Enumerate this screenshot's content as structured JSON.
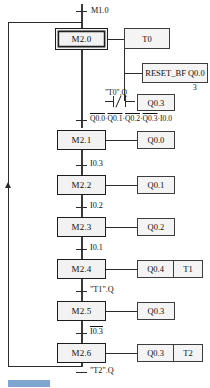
{
  "diagram": {
    "type": "sfc-sequential-function-chart",
    "title": "",
    "initial_transition": {
      "label": "M1.0"
    },
    "steps": [
      {
        "id": "step-m20",
        "label": "M2.0",
        "initial": true
      },
      {
        "id": "step-m21",
        "label": "M2.1",
        "initial": false
      },
      {
        "id": "step-m22",
        "label": "M2.2",
        "initial": false
      },
      {
        "id": "step-m23",
        "label": "M2.3",
        "initial": false
      },
      {
        "id": "step-m24",
        "label": "M2.4",
        "initial": false
      },
      {
        "id": "step-m25",
        "label": "M2.5",
        "initial": false
      },
      {
        "id": "step-m26",
        "label": "M2.6",
        "initial": false
      }
    ],
    "actions": {
      "t0": {
        "label": "T0"
      },
      "reset_bf": {
        "label": "RESET_BF Q0.0",
        "count": "3"
      },
      "contact": {
        "label": "\"T0\".Q",
        "type": "normally-closed"
      },
      "contact_out": {
        "label": "Q0.3"
      },
      "q00": {
        "label": "Q0.0"
      },
      "q01": {
        "label": "Q0.1"
      },
      "q02": {
        "label": "Q0.2"
      },
      "q04": {
        "label": "Q0.4"
      },
      "t1": {
        "label": "T1"
      },
      "q03_m25": {
        "label": "Q0.3"
      },
      "q03_m26": {
        "label": "Q0.3"
      },
      "t2": {
        "label": "T2"
      }
    },
    "transitions": [
      {
        "id": "tr-m20-m21",
        "terms": [
          {
            "text": "Q0.0",
            "negated": true
          },
          {
            "text": "Q0.1",
            "negated": true
          },
          {
            "text": "Q0.2",
            "negated": true
          },
          {
            "text": "Q0.3",
            "negated": true
          },
          {
            "text": "I0.0",
            "negated": false
          }
        ],
        "separator": "·"
      },
      {
        "id": "tr-m21-m22",
        "label": "I0.3",
        "negated": false
      },
      {
        "id": "tr-m22-m23",
        "label": "I0.2",
        "negated": false
      },
      {
        "id": "tr-m23-m24",
        "label": "I0.1",
        "negated": false
      },
      {
        "id": "tr-m24-m25",
        "label": "\"T1\".Q",
        "negated": false
      },
      {
        "id": "tr-m25-m26",
        "label": "I0.3",
        "negated": true
      },
      {
        "id": "tr-m26-return",
        "label": "\"T2\".Q",
        "negated": false
      }
    ]
  },
  "caption": {
    "text": ""
  }
}
